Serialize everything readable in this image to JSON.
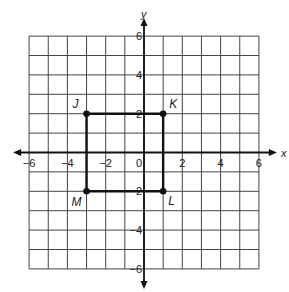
{
  "diagram": {
    "type": "coordinate-plane",
    "x_axis": {
      "label": "x",
      "min": -6,
      "max": 6,
      "tick_labels": [
        "-6",
        "-4",
        "-2",
        "0",
        "2",
        "4",
        "6"
      ]
    },
    "y_axis": {
      "label": "y",
      "min": -6,
      "max": 6,
      "tick_labels": [
        "6",
        "4",
        "2",
        "-2",
        "-4",
        "-6"
      ]
    },
    "grid": {
      "step": 1,
      "color": "#444444"
    },
    "shape": {
      "type": "rectangle",
      "vertices": [
        {
          "name": "J",
          "x": -3,
          "y": 2
        },
        {
          "name": "K",
          "x": 1,
          "y": 2
        },
        {
          "name": "L",
          "x": 1,
          "y": -2
        },
        {
          "name": "M",
          "x": -3,
          "y": -2
        }
      ],
      "color": "#111111"
    }
  }
}
